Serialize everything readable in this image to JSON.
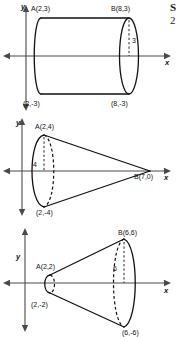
{
  "page": {
    "background_color": "#ffffff",
    "ink_color": "#111111",
    "axis_color": "#4a4a4a",
    "width": 177,
    "height": 337
  },
  "corner_note": {
    "line1": "S",
    "line2": "2"
  },
  "figures": [
    {
      "id": "cylinder",
      "name": "cylinder-diagram",
      "shape_type": "cylinder",
      "description": "Rectangle revolved about the x-axis forming a cylinder",
      "axis_labels": {
        "x": "x",
        "y": "y"
      },
      "points": [
        {
          "key": "A",
          "label": "A(2,3)",
          "x": 2,
          "y": 3
        },
        {
          "key": "B",
          "label": "B(8,3)",
          "x": 8,
          "y": 3
        },
        {
          "key": "C",
          "label": "(2,-3)",
          "x": 2,
          "y": -3
        },
        {
          "key": "D",
          "label": "(8,-3)",
          "x": 8,
          "y": -3
        }
      ],
      "dimension": {
        "label": "3",
        "meaning": "radius"
      }
    },
    {
      "id": "cone",
      "name": "cone-diagram",
      "shape_type": "cone",
      "description": "Triangle revolved about the x-axis forming a cone with apex at B",
      "axis_labels": {
        "x": "x",
        "y": "y"
      },
      "points": [
        {
          "key": "A",
          "label": "A(2,4)",
          "x": 2,
          "y": 4
        },
        {
          "key": "B",
          "label": "B(7,0)",
          "x": 7,
          "y": 0
        },
        {
          "key": "C",
          "label": "(2,-4)",
          "x": 2,
          "y": -4
        }
      ],
      "dimension": {
        "label": "4",
        "meaning": "radius"
      }
    },
    {
      "id": "frustum",
      "name": "frustum-diagram",
      "shape_type": "frustum",
      "description": "Trapezoid revolved about the x-axis forming a truncated cone",
      "axis_labels": {
        "x": "x",
        "y": "y"
      },
      "points": [
        {
          "key": "A",
          "label": "A(2,2)",
          "x": 2,
          "y": 2
        },
        {
          "key": "B",
          "label": "B(6,6)",
          "x": 6,
          "y": 6
        },
        {
          "key": "C",
          "label": "(2,-2)",
          "x": 2,
          "y": -2
        },
        {
          "key": "D",
          "label": "(6,-6)",
          "x": 6,
          "y": -6
        }
      ],
      "dimension": {
        "label": "6",
        "meaning": "large radius"
      }
    }
  ]
}
